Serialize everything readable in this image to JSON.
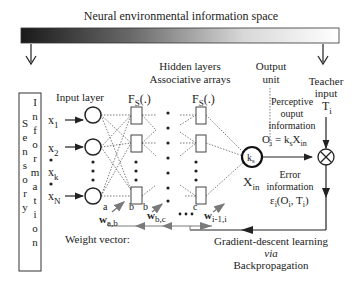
{
  "title": "Neural environmental information space",
  "sensory": {
    "col1": [
      "I",
      "n",
      "f",
      "o",
      "r",
      "m",
      "a",
      "t",
      "i",
      "o",
      "n"
    ],
    "col2": [
      "S",
      "e",
      "n",
      "s",
      "o",
      "r",
      "y"
    ]
  },
  "inputs": {
    "x1": "x",
    "x1_sub": "1",
    "x2": "x",
    "x2_sub": "2",
    "xk": "x",
    "xk_sub": "k",
    "xN": "x",
    "xN_sub": "N"
  },
  "labels": {
    "input_layer": "Input layer",
    "hidden_line1": "Hidden layers",
    "hidden_line2": "Associative arrays",
    "output_line1": "Output",
    "output_line2": "unit",
    "fs1": "F",
    "fs1_sub": "S",
    "fs1_tail": "(.)",
    "fs2": "F",
    "fs2_sub": "S",
    "fs2_tail": "(.)",
    "ks": "k",
    "ks_sub": "s",
    "xin": "X",
    "xin_sub": "in",
    "teacher_line1": "Teacher",
    "teacher_line2": "input",
    "teacher_T": "T",
    "teacher_T_sub": "i",
    "perceptive_line1": "Perceptive",
    "perceptive_line2": "ouput",
    "perceptive_line3": "information",
    "perceptive_eq": "O",
    "perceptive_eq_sub": "i",
    "perceptive_eq_rest": " = k",
    "perceptive_eq_sub2": "s",
    "perceptive_eq_rest2": "X",
    "perceptive_eq_sub3": "in",
    "error_line1": "Error",
    "error_line2": "information",
    "error_eq": "ε",
    "error_eq_sub": "i",
    "error_eq_rest": "(O",
    "error_eq_sub2": "i",
    "error_eq_rest2": ", T",
    "error_eq_sub3": "i",
    "error_eq_rest3": ")",
    "weight_vector": "Weight vector:",
    "w_ab": "w",
    "w_ab_sub": "a,b",
    "w_bc": "w",
    "w_bc_sub": "b,c",
    "w_i": "w",
    "w_i_sub": "i-1,i",
    "node_a": "a",
    "node_b1": "b",
    "node_b2": "b",
    "node_c": "c",
    "gd_line1": "Gradient-descent learning",
    "gd_line2": "via",
    "gd_line3": "Backpropagation"
  },
  "colors": {
    "gradient_start": "#1a1a1a",
    "gradient_end": "#ffffff",
    "line": "#222222",
    "gray_arrow": "#7a7a7a"
  }
}
